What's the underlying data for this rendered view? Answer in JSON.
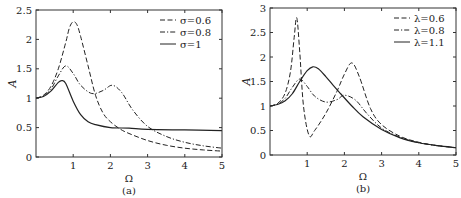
{
  "chart_data": [
    {
      "type": "line",
      "title": "",
      "caption": "(a)",
      "xlabel": "Ω",
      "ylabel": "A",
      "xlim": [
        0,
        5
      ],
      "ylim": [
        0,
        2.5
      ],
      "xticks": [
        "1",
        "2",
        "3",
        "4",
        "5"
      ],
      "yticks": [
        "0",
        "0.5",
        "1",
        "1.5",
        "2",
        "2.5"
      ],
      "grid": false,
      "legend_position": "upper right",
      "series": [
        {
          "name": "σ=0.6",
          "style": "dashed",
          "x": [
            0,
            0.2,
            0.4,
            0.6,
            0.8,
            0.9,
            1.0,
            1.1,
            1.2,
            1.4,
            1.6,
            1.8,
            2.0,
            2.25,
            2.5,
            3.0,
            3.5,
            4.0,
            4.5,
            5.0
          ],
          "y": [
            1.0,
            1.05,
            1.2,
            1.5,
            1.95,
            2.2,
            2.3,
            2.25,
            2.05,
            1.55,
            1.05,
            0.75,
            0.6,
            0.48,
            0.4,
            0.28,
            0.2,
            0.15,
            0.12,
            0.1
          ]
        },
        {
          "name": "σ=0.8",
          "style": "dashdot",
          "x": [
            0,
            0.2,
            0.4,
            0.6,
            0.8,
            1.0,
            1.2,
            1.5,
            1.8,
            2.05,
            2.3,
            2.6,
            3.0,
            3.5,
            4.0,
            4.5,
            5.0
          ],
          "y": [
            1.0,
            1.04,
            1.15,
            1.38,
            1.55,
            1.42,
            1.22,
            1.08,
            1.13,
            1.22,
            1.1,
            0.8,
            0.52,
            0.35,
            0.25,
            0.19,
            0.15
          ]
        },
        {
          "name": "σ=1",
          "style": "solid",
          "x": [
            0,
            0.2,
            0.4,
            0.6,
            0.7,
            0.8,
            1.0,
            1.2,
            1.4,
            1.6,
            2.0,
            2.5,
            3.0,
            4.0,
            5.0
          ],
          "y": [
            1.0,
            1.03,
            1.12,
            1.27,
            1.3,
            1.25,
            0.95,
            0.72,
            0.6,
            0.55,
            0.5,
            0.49,
            0.47,
            0.46,
            0.45
          ]
        }
      ]
    },
    {
      "type": "line",
      "title": "",
      "caption": "(b)",
      "xlabel": "Ω",
      "ylabel": "A",
      "xlim": [
        0,
        5
      ],
      "ylim": [
        0,
        3
      ],
      "xticks": [
        "1",
        "2",
        "3",
        "4",
        "5"
      ],
      "yticks": [
        "0",
        "0.5",
        "1",
        "1.5",
        "2",
        "2.5",
        "3"
      ],
      "grid": false,
      "legend_position": "upper right",
      "series": [
        {
          "name": "λ=0.6",
          "style": "dashed",
          "x": [
            0,
            0.2,
            0.4,
            0.55,
            0.65,
            0.72,
            0.8,
            0.9,
            1.05,
            1.2,
            1.5,
            1.8,
            2.0,
            2.2,
            2.4,
            2.7,
            3.0,
            3.5,
            4.0,
            4.5,
            5.0
          ],
          "y": [
            1.0,
            1.05,
            1.25,
            1.7,
            2.4,
            2.8,
            2.1,
            1.0,
            0.4,
            0.5,
            0.85,
            1.3,
            1.65,
            1.88,
            1.6,
            0.95,
            0.62,
            0.38,
            0.26,
            0.19,
            0.15
          ]
        },
        {
          "name": "λ=0.8",
          "style": "dashdot",
          "x": [
            0,
            0.2,
            0.4,
            0.6,
            0.8,
            1.0,
            1.2,
            1.5,
            1.8,
            2.0,
            2.3,
            2.6,
            3.0,
            3.5,
            4.0,
            4.5,
            5.0
          ],
          "y": [
            1.0,
            1.04,
            1.15,
            1.38,
            1.55,
            1.4,
            1.2,
            1.08,
            1.13,
            1.22,
            1.12,
            0.85,
            0.55,
            0.36,
            0.25,
            0.19,
            0.15
          ]
        },
        {
          "name": "λ=1.1",
          "style": "solid",
          "x": [
            0,
            0.2,
            0.4,
            0.6,
            0.8,
            1.0,
            1.15,
            1.3,
            1.5,
            1.7,
            1.9,
            2.2,
            2.5,
            3.0,
            3.5,
            4.0,
            4.5,
            5.0
          ],
          "y": [
            1.0,
            1.03,
            1.1,
            1.25,
            1.5,
            1.72,
            1.8,
            1.76,
            1.6,
            1.42,
            1.25,
            1.0,
            0.78,
            0.52,
            0.35,
            0.25,
            0.19,
            0.15
          ]
        }
      ]
    }
  ]
}
